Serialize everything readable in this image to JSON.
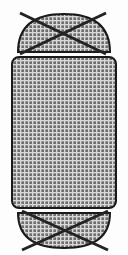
{
  "canvas": {
    "width": 128,
    "height": 255,
    "background_color": "#fdfdfd",
    "title": "Hatched Vessel Cross-Section"
  },
  "palette": {
    "outline_color": "#1a1a1a",
    "hatch_dark": "#6e6e6e",
    "hatch_mid": "#8c8c8c",
    "hatch_light": "#d8d8d8",
    "cross_color": "#232323",
    "fill_base": "#9a9a9a"
  },
  "pattern": {
    "name": "cross-hatch-grid",
    "cell_pitch_px": 4,
    "line_width_px": 1.4,
    "description": "Orthogonal grid of light lines over mid-gray fill forming small squares"
  },
  "shapes": {
    "top_cap": {
      "name": "top-dome",
      "kind": "dome",
      "left_x": 18,
      "right_x": 110,
      "base_y": 52,
      "apex_y": 14,
      "crossed_out": true
    },
    "body": {
      "name": "central-body",
      "kind": "rounded-rectangle",
      "left_x": 12,
      "right_x": 116,
      "top_y": 57,
      "bottom_y": 208,
      "corner_radius": 7,
      "crossed_out": false
    },
    "bottom_cap": {
      "name": "bottom-dome",
      "kind": "dome-inverted",
      "left_x": 18,
      "right_x": 110,
      "base_y": 213,
      "apex_y": 248,
      "crossed_out": true
    }
  },
  "crosses": [
    {
      "name": "top-cross",
      "stroke_width": 3,
      "lines": [
        {
          "x1": 20,
          "y1": 13,
          "x2": 106,
          "y2": 54
        },
        {
          "x1": 106,
          "y1": 13,
          "x2": 20,
          "y2": 54
        }
      ]
    },
    {
      "name": "bottom-cross",
      "stroke_width": 3,
      "lines": [
        {
          "x1": 22,
          "y1": 211,
          "x2": 108,
          "y2": 250
        },
        {
          "x1": 108,
          "y1": 211,
          "x2": 22,
          "y2": 250
        }
      ]
    }
  ],
  "labels": {
    "figure_alt": "Vertically symmetric hatched vessel: domed top cap crossed out, hatched central body, domed bottom cap crossed out"
  }
}
